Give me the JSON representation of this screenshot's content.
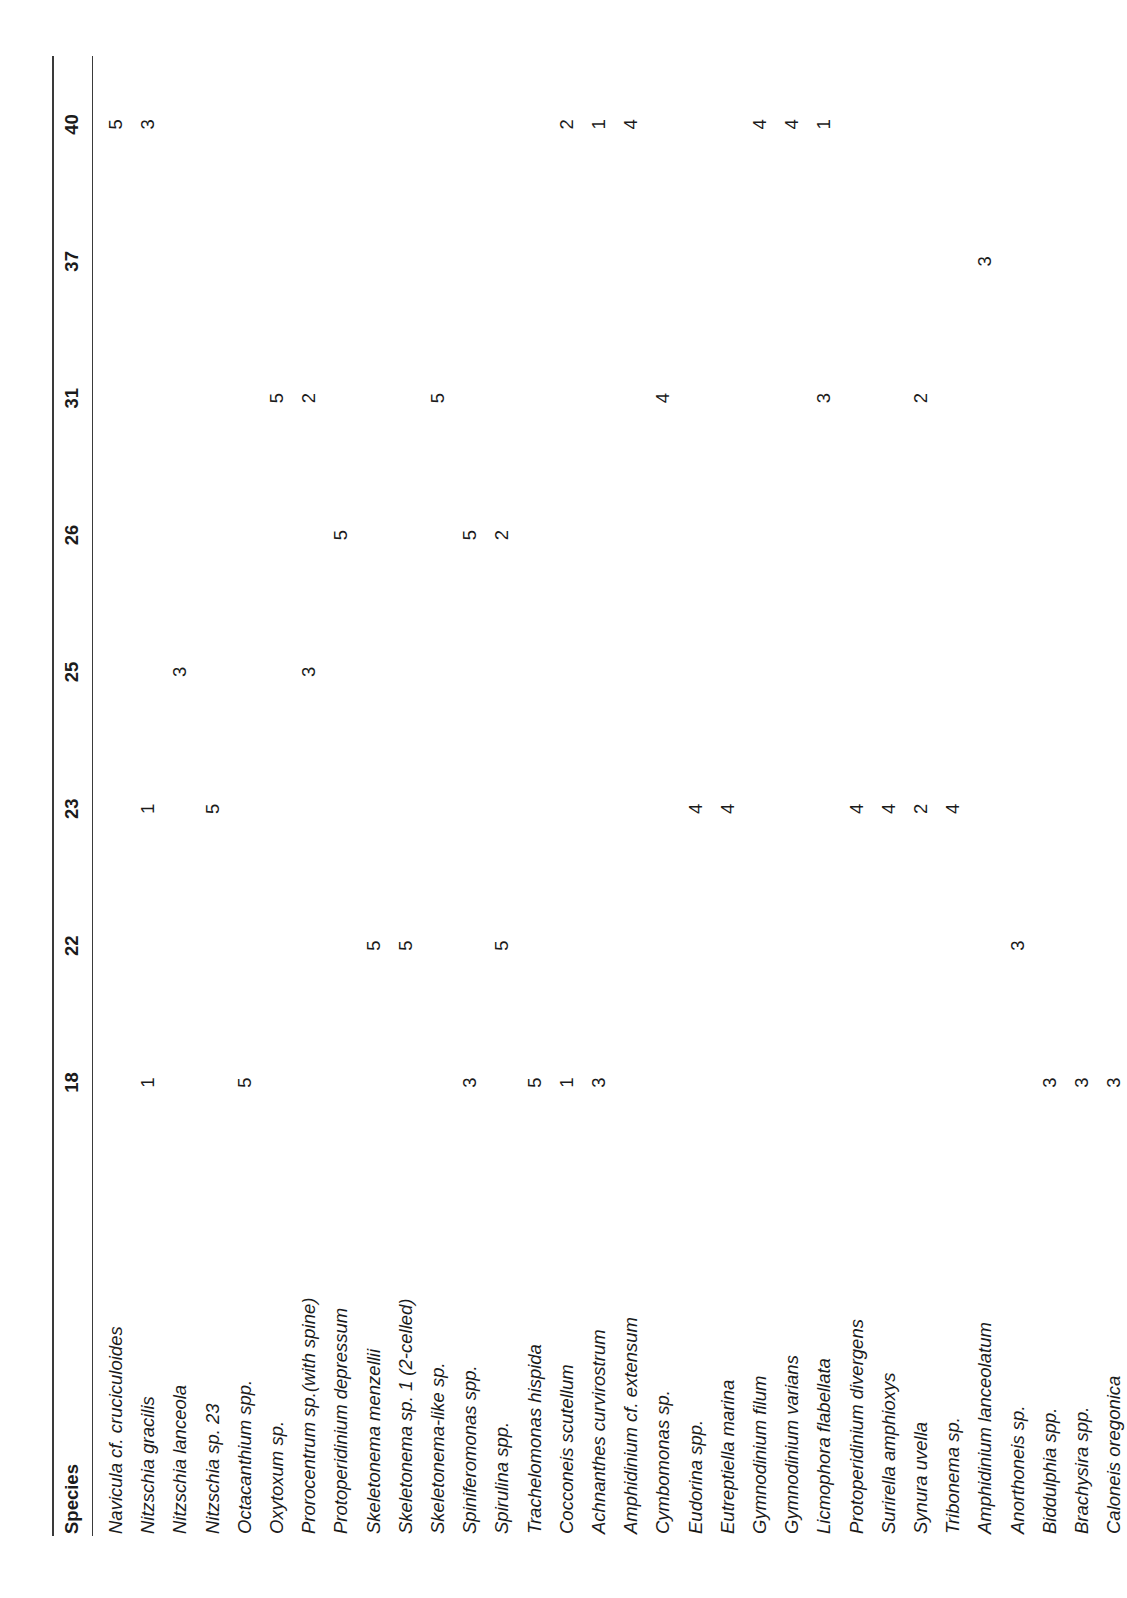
{
  "table": {
    "species_header": "Species",
    "columns": [
      "18",
      "22",
      "23",
      "25",
      "26",
      "31",
      "37",
      "40"
    ],
    "rows": [
      {
        "species": "Navicula cf. cruciculoides",
        "values": [
          "",
          "",
          "",
          "",
          "",
          "",
          "",
          "5"
        ]
      },
      {
        "species": "Nitzschia gracilis",
        "values": [
          "1",
          "",
          "1",
          "",
          "",
          "",
          "",
          "3"
        ]
      },
      {
        "species": "Nitzschia lanceola",
        "values": [
          "",
          "",
          "",
          "3",
          "",
          "",
          "",
          ""
        ]
      },
      {
        "species": "Nitzschia sp. 23",
        "values": [
          "",
          "",
          "5",
          "",
          "",
          "",
          "",
          ""
        ]
      },
      {
        "species": "Octacanthium spp.",
        "values": [
          "5",
          "",
          "",
          "",
          "",
          "",
          "",
          ""
        ]
      },
      {
        "species": "Oxytoxum sp.",
        "values": [
          "",
          "",
          "",
          "",
          "",
          "5",
          "",
          ""
        ]
      },
      {
        "species": "Prorocentrum sp.(with spine)",
        "values": [
          "",
          "",
          "",
          "3",
          "",
          "2",
          "",
          ""
        ]
      },
      {
        "species": "Protoperidinium depressum",
        "values": [
          "",
          "",
          "",
          "",
          "5",
          "",
          "",
          ""
        ]
      },
      {
        "species": "Skeletonema menzellii",
        "values": [
          "",
          "5",
          "",
          "",
          "",
          "",
          "",
          ""
        ]
      },
      {
        "species": "Skeletonema sp. 1 (2-celled)",
        "values": [
          "",
          "5",
          "",
          "",
          "",
          "",
          "",
          ""
        ]
      },
      {
        "species": "Skeletonema-like sp.",
        "values": [
          "",
          "",
          "",
          "",
          "",
          "5",
          "",
          ""
        ]
      },
      {
        "species": "Spiniferomonas spp.",
        "values": [
          "3",
          "",
          "",
          "",
          "5",
          "",
          "",
          ""
        ]
      },
      {
        "species": "Spirulina spp.",
        "values": [
          "",
          "5",
          "",
          "",
          "2",
          "",
          "",
          ""
        ]
      },
      {
        "species": "Trachelomonas hispida",
        "values": [
          "5",
          "",
          "",
          "",
          "",
          "",
          "",
          ""
        ]
      },
      {
        "species": "Cocconeis scutellum",
        "values": [
          "1",
          "",
          "",
          "",
          "",
          "",
          "",
          "2"
        ]
      },
      {
        "species": "Achnanthes curvirostrum",
        "values": [
          "3",
          "",
          "",
          "",
          "",
          "",
          "",
          "1"
        ]
      },
      {
        "species": "Amphidinium cf. extensum",
        "values": [
          "",
          "",
          "",
          "",
          "",
          "",
          "",
          "4"
        ]
      },
      {
        "species": "Cymbomonas sp.",
        "values": [
          "",
          "",
          "",
          "",
          "",
          "4",
          "",
          ""
        ]
      },
      {
        "species": "Eudorina spp.",
        "values": [
          "",
          "",
          "4",
          "",
          "",
          "",
          "",
          ""
        ]
      },
      {
        "species": "Eutreptiella marina",
        "values": [
          "",
          "",
          "4",
          "",
          "",
          "",
          "",
          ""
        ]
      },
      {
        "species": "Gymnodinium filum",
        "values": [
          "",
          "",
          "",
          "",
          "",
          "",
          "",
          "4"
        ]
      },
      {
        "species": "Gymnodinium varians",
        "values": [
          "",
          "",
          "",
          "",
          "",
          "",
          "",
          "4"
        ]
      },
      {
        "species": "Licmophora flabellata",
        "values": [
          "",
          "",
          "",
          "",
          "",
          "3",
          "",
          "1"
        ]
      },
      {
        "species": "Protoperidinium divergens",
        "values": [
          "",
          "",
          "4",
          "",
          "",
          "",
          "",
          ""
        ]
      },
      {
        "species": "Surirella amphioxys",
        "values": [
          "",
          "",
          "4",
          "",
          "",
          "",
          "",
          ""
        ]
      },
      {
        "species": "Synura uvella",
        "values": [
          "",
          "",
          "2",
          "",
          "",
          "2",
          "",
          ""
        ]
      },
      {
        "species": "Tribonema sp.",
        "values": [
          "",
          "",
          "4",
          "",
          "",
          "",
          "",
          ""
        ]
      },
      {
        "species": "Amphidinium lanceolatum",
        "values": [
          "",
          "",
          "",
          "",
          "",
          "",
          "3",
          ""
        ]
      },
      {
        "species": "Anorthoneis sp.",
        "values": [
          "",
          "3",
          "",
          "",
          "",
          "",
          "",
          ""
        ]
      },
      {
        "species": "Biddulphia spp.",
        "values": [
          "3",
          "",
          "",
          "",
          "",
          "",
          "",
          ""
        ]
      },
      {
        "species": "Brachysira spp.",
        "values": [
          "3",
          "",
          "",
          "",
          "",
          "",
          "",
          ""
        ]
      },
      {
        "species": "Caloneis oregonica",
        "values": [
          "3",
          "",
          "",
          "",
          "",
          "",
          "",
          ""
        ]
      }
    ]
  }
}
